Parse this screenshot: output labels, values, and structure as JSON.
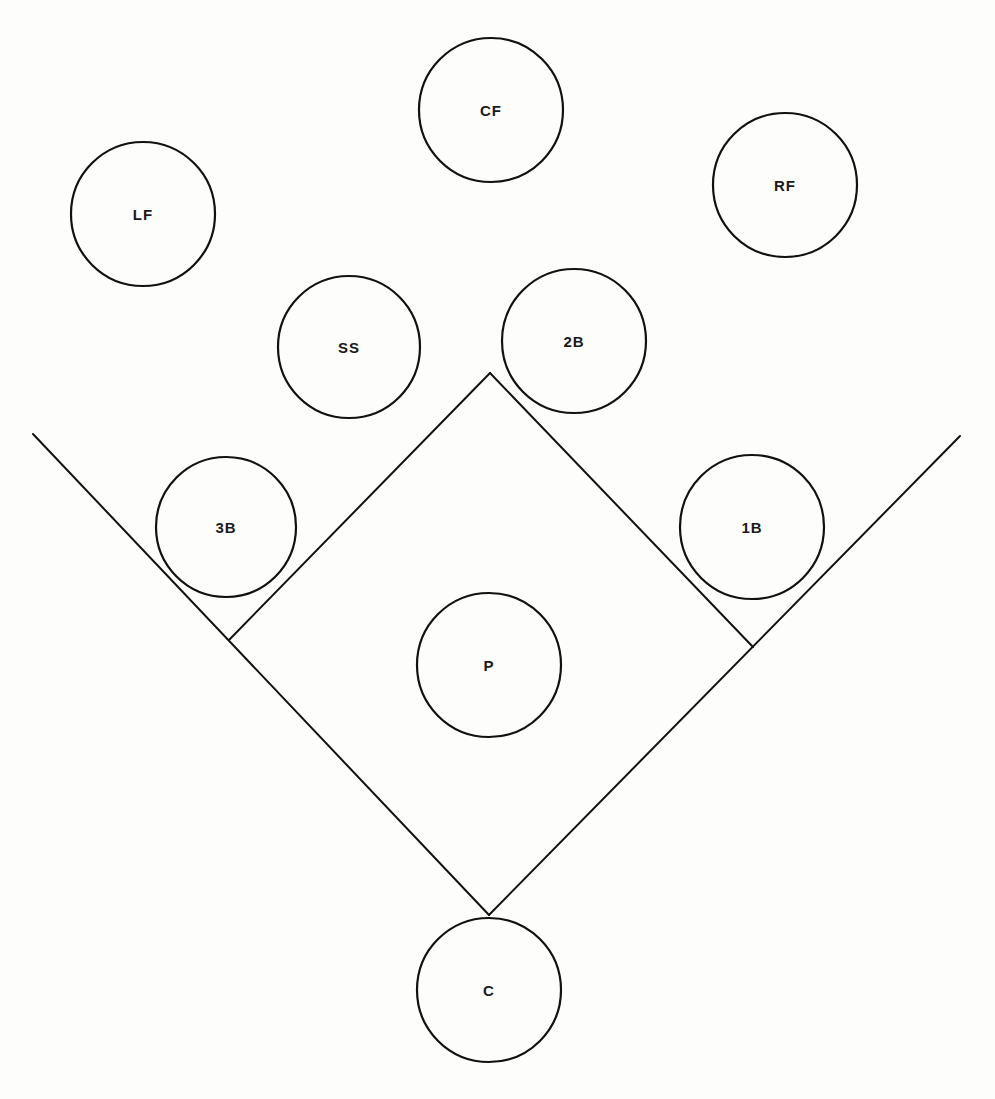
{
  "diagram": {
    "title": "",
    "positions": [
      {
        "id": "cf",
        "label": "CF",
        "cx": 491,
        "cy": 110,
        "r": 72
      },
      {
        "id": "lf",
        "label": "LF",
        "cx": 143,
        "cy": 214,
        "r": 72
      },
      {
        "id": "rf",
        "label": "RF",
        "cx": 785,
        "cy": 185,
        "r": 72
      },
      {
        "id": "ss",
        "label": "SS",
        "cx": 349,
        "cy": 347,
        "r": 71
      },
      {
        "id": "2b",
        "label": "2B",
        "cx": 574,
        "cy": 341,
        "r": 72
      },
      {
        "id": "3b",
        "label": "3B",
        "cx": 226,
        "cy": 527,
        "r": 70
      },
      {
        "id": "1b",
        "label": "1B",
        "cx": 752,
        "cy": 527,
        "r": 72
      },
      {
        "id": "p",
        "label": "P",
        "cx": 489,
        "cy": 665,
        "r": 72
      },
      {
        "id": "c",
        "label": "C",
        "cx": 489,
        "cy": 990,
        "r": 72
      }
    ],
    "lines": [
      {
        "id": "third-base-foul-line",
        "x1": 33,
        "y1": 434,
        "x2": 489,
        "y2": 915
      },
      {
        "id": "first-base-foul-line",
        "x1": 960,
        "y1": 436,
        "x2": 489,
        "y2": 915
      },
      {
        "id": "third-to-second-basepath",
        "x1": 229,
        "y1": 640,
        "x2": 490,
        "y2": 373
      },
      {
        "id": "second-to-first-basepath",
        "x1": 490,
        "y1": 373,
        "x2": 753,
        "y2": 647
      }
    ]
  }
}
